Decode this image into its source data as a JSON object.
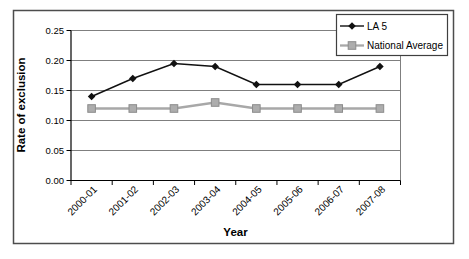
{
  "chart": {
    "colors": {
      "la5_series": "#111111",
      "national_average_series": "#a8a8a8",
      "national_average_marker_fill": "#adadad",
      "national_average_marker_stroke": "#8c8c8c",
      "gridline": "#7f7f7f",
      "axis": "#000000",
      "outer_border": "#4d4d4d",
      "legend_border": "#3f3f3f",
      "background": "#ffffff"
    },
    "legend": {
      "position": "top-right",
      "items": [
        "LA 5",
        "National Average"
      ]
    }
  },
  "chart_data": {
    "type": "line",
    "title": "",
    "xlabel": "Year",
    "ylabel": "Rate of exclusion",
    "categories": [
      "2000-01",
      "2001-02",
      "2002-03",
      "2003-04",
      "2004-05",
      "2005-06",
      "2006-07",
      "2007-08"
    ],
    "series": [
      {
        "name": "LA 5",
        "marker": "diamond",
        "color": "#111111",
        "values": [
          0.14,
          0.17,
          0.195,
          0.19,
          0.16,
          0.16,
          0.16,
          0.19
        ]
      },
      {
        "name": "National Average",
        "marker": "square",
        "color": "#a8a8a8",
        "values": [
          0.12,
          0.12,
          0.12,
          0.13,
          0.12,
          0.12,
          0.12,
          0.12
        ]
      }
    ],
    "ylim": [
      0,
      0.25
    ],
    "y_ticks": [
      0,
      0.05,
      0.1,
      0.15,
      0.2,
      0.25
    ],
    "y_tick_decimals": 2,
    "grid": true,
    "legend_position": "top-right",
    "x_label_rotation_deg": 45
  }
}
